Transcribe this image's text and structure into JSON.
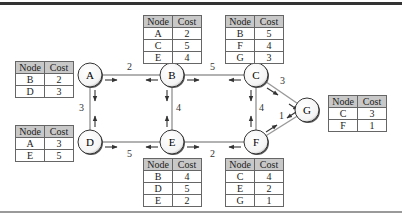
{
  "diagram": {
    "nodes": [
      {
        "id": "A",
        "label": "A"
      },
      {
        "id": "B",
        "label": "B"
      },
      {
        "id": "C",
        "label": "C"
      },
      {
        "id": "D",
        "label": "D"
      },
      {
        "id": "E",
        "label": "E"
      },
      {
        "id": "F",
        "label": "F"
      },
      {
        "id": "G",
        "label": "G"
      }
    ],
    "edges": [
      {
        "from": "A",
        "to": "B",
        "cost": "2"
      },
      {
        "from": "B",
        "to": "C",
        "cost": "5"
      },
      {
        "from": "A",
        "to": "D",
        "cost": "3"
      },
      {
        "from": "B",
        "to": "E",
        "cost": "4"
      },
      {
        "from": "C",
        "to": "F",
        "cost": "4"
      },
      {
        "from": "D",
        "to": "E",
        "cost": "5"
      },
      {
        "from": "E",
        "to": "F",
        "cost": "2"
      },
      {
        "from": "C",
        "to": "G",
        "cost": "3"
      },
      {
        "from": "F",
        "to": "G",
        "cost": "1"
      }
    ],
    "table_headers": {
      "node": "Node",
      "cost": "Cost"
    },
    "tables": {
      "A": [
        {
          "node": "B",
          "cost": "2"
        },
        {
          "node": "D",
          "cost": "3"
        }
      ],
      "B": [
        {
          "node": "A",
          "cost": "2"
        },
        {
          "node": "C",
          "cost": "5"
        },
        {
          "node": "E",
          "cost": "4"
        }
      ],
      "C": [
        {
          "node": "B",
          "cost": "5"
        },
        {
          "node": "F",
          "cost": "4"
        },
        {
          "node": "G",
          "cost": "3"
        }
      ],
      "D": [
        {
          "node": "A",
          "cost": "3"
        },
        {
          "node": "E",
          "cost": "5"
        }
      ],
      "E": [
        {
          "node": "B",
          "cost": "4"
        },
        {
          "node": "D",
          "cost": "5"
        },
        {
          "node": "E",
          "cost": "2"
        }
      ],
      "F": [
        {
          "node": "C",
          "cost": "4"
        },
        {
          "node": "E",
          "cost": "2"
        },
        {
          "node": "G",
          "cost": "1"
        }
      ],
      "G": [
        {
          "node": "C",
          "cost": "3"
        },
        {
          "node": "F",
          "cost": "1"
        }
      ]
    }
  }
}
